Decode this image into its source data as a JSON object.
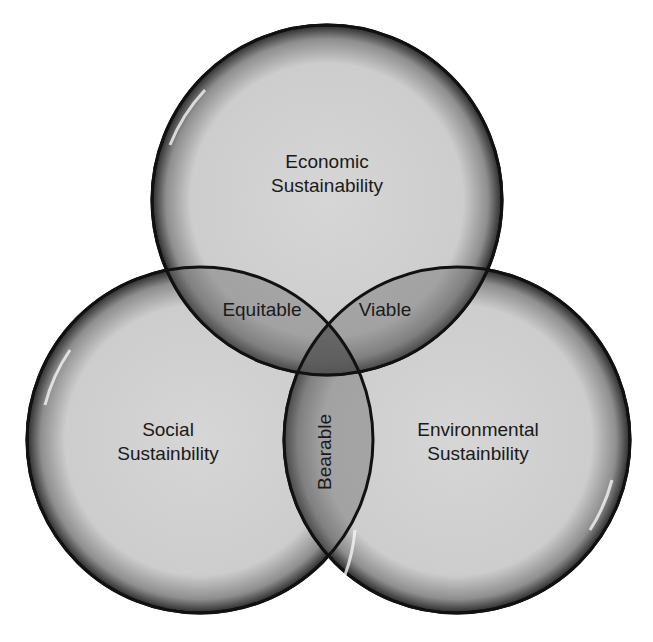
{
  "diagram": {
    "type": "venn",
    "circles": [
      {
        "id": "economic",
        "line1": "Economic",
        "line2": "Sustainability"
      },
      {
        "id": "social",
        "line1": "Social",
        "line2": "Sustainbility"
      },
      {
        "id": "environmental",
        "line1": "Environmental",
        "line2": "Sustainbility"
      }
    ],
    "intersections": {
      "economic_social": "Equitable",
      "economic_environmental": "Viable",
      "social_environmental": "Bearable"
    },
    "colors": {
      "fill": "#cfcfcf",
      "overlap": "#8a8a8a",
      "outline": "#111111"
    }
  }
}
